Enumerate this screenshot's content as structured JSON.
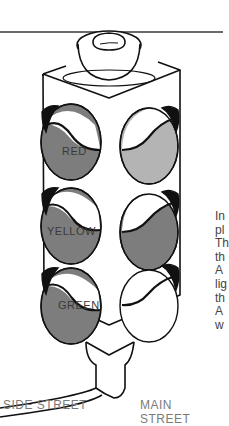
{
  "figure": {
    "colors": {
      "lit_lamp": "#7d7d7d",
      "unlit_lamp_light": "#b4b4b4",
      "outline": "#111111",
      "rule": "#6a6a6a"
    },
    "lamps": [
      {
        "label": "RED",
        "side": "side-street",
        "state": "lit"
      },
      {
        "label": "YELLOW",
        "side": "side-street",
        "state": "lit"
      },
      {
        "label": "GREEN",
        "side": "side-street",
        "state": "lit"
      }
    ],
    "street_labels": {
      "left": "SIDE STREET",
      "right": "MAIN STREET"
    },
    "paragraph_fragments": [
      "In",
      "pl",
      "Th",
      "th",
      "A",
      "lig",
      "th",
      "A",
      "w"
    ]
  }
}
